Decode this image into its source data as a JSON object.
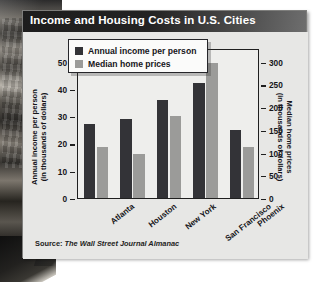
{
  "header": {
    "title": "Income and Housing Costs in U.S. Cities"
  },
  "source": {
    "prefix": "Source:",
    "name": "The Wall Street Journal Almanac"
  },
  "colors": {
    "title_bar": "#1d1d1d",
    "card_background": "#e9e9e7",
    "series_income": "#333337",
    "series_home_prices": "#9b9b99",
    "axis": "#1f1f1f",
    "text": "#16161a"
  },
  "legend": {
    "entries": [
      {
        "label": "Annual income per person",
        "swatch": "#333337"
      },
      {
        "label": "Median home prices",
        "swatch": "#9b9b99"
      }
    ]
  },
  "axes": {
    "left": {
      "title_line1": "Annual income per person",
      "title_line2": "(in thousands of dollars)",
      "ticks": [
        "50",
        "40",
        "30",
        "20",
        "10",
        "0"
      ],
      "min": 0,
      "max": 55
    },
    "right": {
      "title_line1": "Median home prices",
      "title_line2": "(in thousands of dollars)",
      "ticks": [
        "300",
        "250",
        "200",
        "150",
        "100",
        "50",
        "0"
      ],
      "min": 0,
      "max": 330
    }
  },
  "chart_data": {
    "type": "bar",
    "title": "Income and Housing Costs in U.S. Cities",
    "xlabel": "",
    "ylabel": "Annual income per person (in thousands of dollars)",
    "y2label": "Median home prices (in thousands of dollars)",
    "ylim": [
      0,
      55
    ],
    "y2lim": [
      0,
      330
    ],
    "yticks": [
      0,
      10,
      20,
      30,
      40,
      50
    ],
    "y2ticks": [
      0,
      50,
      100,
      150,
      200,
      250,
      300
    ],
    "grid": false,
    "legend_position": "top-left-inside",
    "categories": [
      "Atlanta",
      "Houston",
      "New York",
      "San Francisco",
      "Phoenix"
    ],
    "series": [
      {
        "name": "Annual income per person",
        "axis": "left",
        "unit": "thousands of dollars",
        "color": "#333337",
        "values": [
          27,
          29,
          36,
          42,
          25
        ]
      },
      {
        "name": "Median home prices",
        "axis": "right",
        "unit": "thousands of dollars",
        "color": "#9b9b99",
        "values": [
          113,
          96,
          180,
          296,
          112
        ]
      }
    ],
    "source": "Source: The Wall Street Journal Almanac"
  }
}
